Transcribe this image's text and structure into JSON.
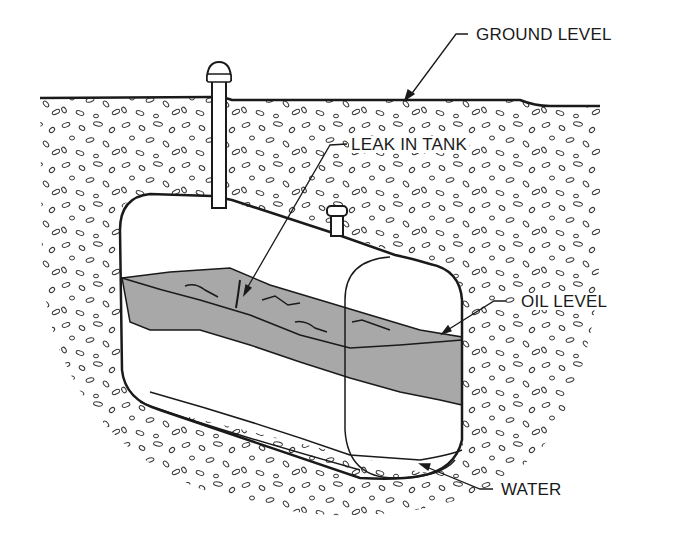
{
  "diagram": {
    "labels": {
      "ground_level": "GROUND LEVEL",
      "leak_in_tank": "LEAK IN TANK",
      "oil_level": "OIL LEVEL",
      "water": "WATER"
    },
    "colors": {
      "line": "#1a1a1a",
      "oil_fill": "#a8a8a8",
      "background": "#ffffff",
      "pebble": "#333333"
    }
  }
}
